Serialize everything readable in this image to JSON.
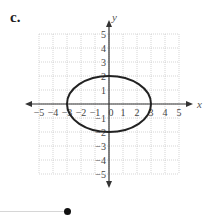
{
  "figure": {
    "label": "c."
  },
  "chart_data": {
    "type": "line",
    "title": "",
    "xlabel": "x",
    "ylabel": "y",
    "xlim": [
      -5,
      5
    ],
    "ylim": [
      -5,
      5
    ],
    "grid": true,
    "x_ticks": [
      "-5",
      "-4",
      "-3",
      "-2",
      "-1",
      "0",
      "1",
      "2",
      "3",
      "4",
      "5"
    ],
    "y_ticks": [
      "5",
      "4",
      "3",
      "2",
      "1",
      "-1",
      "-2",
      "-3",
      "-4",
      "-5"
    ],
    "curve": {
      "shape": "ellipse",
      "center": [
        0,
        0
      ],
      "semi_axis_x": 3,
      "semi_axis_y": 2,
      "equation": "x^2/9 + y^2/4 = 1"
    },
    "series": [
      {
        "name": "ellipse",
        "x_intercepts": [
          -3,
          3
        ],
        "y_intercepts": [
          -2,
          2
        ]
      }
    ]
  },
  "slider": {
    "value_position": "end"
  }
}
